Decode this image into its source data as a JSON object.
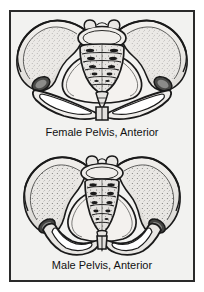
{
  "plate": {
    "background_color": "#f2f2f0",
    "border_color": "#2a2a2a",
    "page_background": "#ffffff",
    "ink_color": "#1a1a1a",
    "bone_fill": "#ebe9e6",
    "shadow_fill": "#9a9a98",
    "stipple_color": "#6e6e6c"
  },
  "figures": [
    {
      "id": "female-pelvis",
      "caption": "Female Pelvis, Anterior",
      "view": "anterior",
      "subject": "female pelvis",
      "parts": [
        "right ilium",
        "left ilium",
        "sacrum",
        "coccyx",
        "lumbar vertebra L5",
        "right obturator foramen",
        "left obturator foramen",
        "pubic symphysis",
        "right acetabulum",
        "left acetabulum",
        "subpubic arch"
      ],
      "sacral_segment_count": 5,
      "traits": {
        "inlet_shape": "oval, wide",
        "subpubic_angle": "wide",
        "ilia": "flared"
      }
    },
    {
      "id": "male-pelvis",
      "caption": "Male Pelvis, Anterior",
      "view": "anterior",
      "subject": "male pelvis",
      "parts": [
        "right ilium",
        "left ilium",
        "sacrum",
        "coccyx",
        "lumbar vertebra L5",
        "right obturator foramen",
        "left obturator foramen",
        "pubic symphysis",
        "right acetabulum",
        "left acetabulum",
        "subpubic angle"
      ],
      "sacral_segment_count": 5,
      "traits": {
        "inlet_shape": "heart-shaped, narrow",
        "subpubic_angle": "narrow",
        "ilia": "upright"
      }
    }
  ]
}
